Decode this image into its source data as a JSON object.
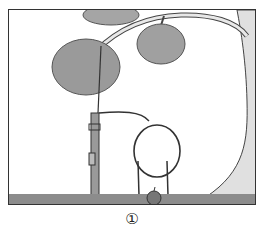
{
  "figure": {
    "caption": "①",
    "colors": {
      "foliage": "#9a9a9a",
      "trunk": "#d8d8d8",
      "grass": "#8c8c8c",
      "apple": "#7a7a7a",
      "outline": "#333333"
    }
  }
}
